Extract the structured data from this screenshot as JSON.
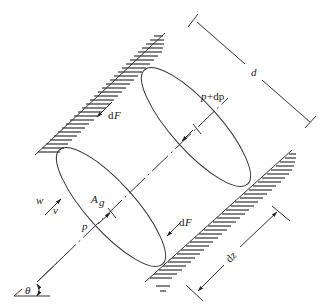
{
  "diagram": {
    "type": "cylindrical control volume between inclined walls",
    "labels": {
      "d": "d",
      "p_plus_dp_p": "p",
      "p_plus_dp_rest": "+dp",
      "dF_top_d": "d",
      "dF_top_F": "F",
      "dF_bottom_d": "d",
      "dF_bottom_F": "F",
      "A_g_A": "A",
      "A_g_sub": "g",
      "w": "w",
      "v": "v",
      "p": "p",
      "dz_d": "d",
      "dz_z": "z",
      "theta": "θ"
    },
    "colors": {
      "line": "#333333",
      "text": "#222222",
      "background": "#ffffff"
    }
  }
}
